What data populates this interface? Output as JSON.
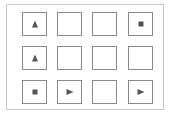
{
  "grid": {
    "rows": 3,
    "cols": 4,
    "cells": [
      [
        "triangle-up",
        "empty",
        "empty",
        "square"
      ],
      [
        "triangle-up",
        "empty",
        "empty",
        "empty"
      ],
      [
        "square",
        "triangle-right",
        "empty",
        "triangle-right"
      ]
    ]
  },
  "colors": {
    "border": "#8a8a8a",
    "symbol": "#555555",
    "frame": "#c8c8c8"
  }
}
